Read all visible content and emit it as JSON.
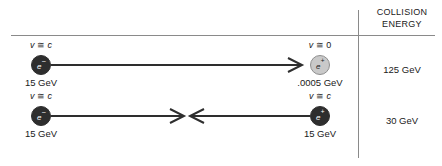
{
  "figure": {
    "width": 442,
    "height": 166,
    "background": "#ffffff",
    "rule_color": "#8a8a8a"
  },
  "column_header": {
    "line1": "COLLISION",
    "line2": "ENERGY"
  },
  "rows": [
    {
      "id": "fixed-target",
      "collision_energy": "125 GeV",
      "left_particle": {
        "symbol": "e",
        "charge": "–",
        "velocity_label": "v ≅ c",
        "velocity_var": "v",
        "velocity_rel": "≅",
        "velocity_value": "c",
        "energy": "15 GeV",
        "fill": "#2e2e2e",
        "style": "dark"
      },
      "right_particle": {
        "symbol": "e",
        "charge": "+",
        "velocity_label": "v ≅ 0",
        "velocity_var": "v",
        "velocity_rel": "≅",
        "velocity_value": "0",
        "energy": ".0005 GeV",
        "fill": "#c9c9c9",
        "style": "light"
      },
      "arrows": "single-right"
    },
    {
      "id": "collider",
      "collision_energy": "30 GeV",
      "left_particle": {
        "symbol": "e",
        "charge": "–",
        "velocity_label": "v ≅ c",
        "velocity_var": "v",
        "velocity_rel": "≅",
        "velocity_value": "c",
        "energy": "15 GeV",
        "fill": "#2e2e2e",
        "style": "dark"
      },
      "right_particle": {
        "symbol": "e",
        "charge": "+",
        "velocity_label": "v ≅ c",
        "velocity_var": "v",
        "velocity_rel": "≅",
        "velocity_value": "c",
        "energy": "15 GeV",
        "fill": "#2e2e2e",
        "style": "dark"
      },
      "arrows": "converging"
    }
  ]
}
